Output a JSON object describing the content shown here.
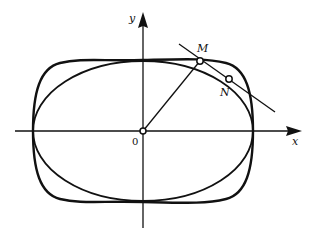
{
  "diagram": {
    "axes": {
      "x_label": "x",
      "y_label": "y",
      "origin_label": "0"
    },
    "points": {
      "M": {
        "label": "M",
        "x": 200,
        "y": 61
      },
      "N": {
        "label": "N",
        "x": 229,
        "y": 79
      }
    },
    "curves": [
      {
        "name": "ellipse",
        "description": "inner ellipse through M"
      },
      {
        "name": "superellipse",
        "description": "outer rounded-rectangle curve through N"
      }
    ],
    "lines": [
      {
        "name": "radius-OM",
        "description": "segment from origin O to point M"
      },
      {
        "name": "secant-MN",
        "description": "line through M and N extended"
      }
    ],
    "colors": {
      "stroke": "#111111",
      "background": "#ffffff"
    }
  }
}
